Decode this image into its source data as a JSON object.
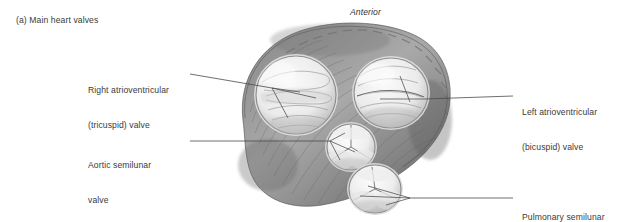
{
  "figure": {
    "caption": "(a) Main heart valves",
    "orientation_label": "Anterior",
    "view": "superior view of heart valves with atria removed",
    "style": "grayscale pencil/airbrush medical illustration"
  },
  "labels": {
    "right_av": {
      "line1": "Right atrioventricular",
      "line2": "(tricuspid) valve"
    },
    "aortic": {
      "line1": "Aortic semilunar",
      "line2": "valve"
    },
    "left_av": {
      "line1": "Left atrioventricular",
      "line2": "(bicuspid) valve"
    },
    "pulmonary": {
      "line1": "Pulmonary semilunar",
      "line2": "valve"
    }
  },
  "colors": {
    "background": "#ffffff",
    "text": "#3a3a3a",
    "leader_line": "#4a4a4a",
    "rim_dark": "#5f5f5f",
    "rim_mid": "#8e8e8e",
    "valve_light": "#f2f2f2",
    "valve_shadow": "#bdbdbd",
    "cusp_line": "#7a7a7a"
  },
  "structures": [
    {
      "name": "right-atrioventricular-valve",
      "shape": "large rounded opening, upper left",
      "cusps": 3
    },
    {
      "name": "left-atrioventricular-valve",
      "shape": "large rounded opening, upper right",
      "cusps": 2
    },
    {
      "name": "aortic-semilunar-valve",
      "shape": "small circular opening, center",
      "cusps": 3
    },
    {
      "name": "pulmonary-semilunar-valve",
      "shape": "small circular opening, lower right",
      "cusps": 3
    },
    {
      "name": "fibrous-skeleton-rim",
      "shape": "dark ridged band encircling the valves",
      "cusps": 0
    }
  ]
}
